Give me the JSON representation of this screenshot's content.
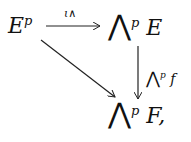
{
  "diagram": {
    "type": "commutative-diagram",
    "nodes": {
      "source": {
        "base": "E",
        "sup": "p"
      },
      "top_right": {
        "wedge": "⋀",
        "sup": "p",
        "arg": "E"
      },
      "bottom_right": {
        "wedge": "⋀",
        "sup": "p",
        "arg": "F,"
      }
    },
    "arrows": {
      "top": {
        "label": "ι∧"
      },
      "right": {
        "label_wedge": "⋀",
        "label_sup": "p",
        "label_arg": "f"
      },
      "diagonal": {
        "label": ""
      }
    }
  }
}
